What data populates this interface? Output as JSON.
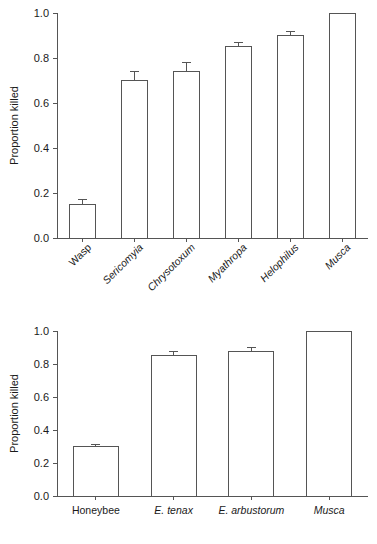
{
  "figure": {
    "background": "#ffffff",
    "line_color": "#555555",
    "text_color": "#1a1a1a",
    "bar_fill": "#ffffff"
  },
  "chart_data": [
    {
      "type": "bar",
      "panel": "top",
      "title": "",
      "xlabel": "",
      "ylabel": "Proportion killed",
      "ylim": [
        0.0,
        1.0
      ],
      "yticks": [
        0.0,
        0.2,
        0.4,
        0.6,
        0.8,
        1.0
      ],
      "ytick_labels": [
        "0.0",
        "0.2",
        "0.4",
        "0.6",
        "0.8",
        "1.0"
      ],
      "grid": false,
      "legend": "none",
      "tick_label_rotation": 45,
      "categories": [
        "Wasp",
        "Sericomyia",
        "Chrysotoxum",
        "Myathropa",
        "Helophilus",
        "Musca"
      ],
      "category_styles": [
        "normal",
        "italic",
        "italic",
        "italic",
        "italic",
        "italic"
      ],
      "values": [
        0.15,
        0.7,
        0.74,
        0.85,
        0.9,
        1.0
      ],
      "errors": [
        0.02,
        0.04,
        0.04,
        0.02,
        0.02,
        0.0
      ]
    },
    {
      "type": "bar",
      "panel": "bottom",
      "title": "",
      "xlabel": "",
      "ylabel": "Proportion killed",
      "ylim": [
        0.0,
        1.0
      ],
      "yticks": [
        0.0,
        0.2,
        0.4,
        0.6,
        0.8,
        1.0
      ],
      "ytick_labels": [
        "0.0",
        "0.2",
        "0.4",
        "0.6",
        "0.8",
        "1.0"
      ],
      "grid": false,
      "legend": "none",
      "tick_label_rotation": 0,
      "categories": [
        "Honeybee",
        "E. tenax",
        "E. arbustorum",
        "Musca"
      ],
      "category_styles": [
        "normal",
        "italic",
        "italic",
        "italic"
      ],
      "values": [
        0.3,
        0.85,
        0.875,
        1.0
      ],
      "errors": [
        0.015,
        0.025,
        0.025,
        0.0
      ]
    }
  ]
}
